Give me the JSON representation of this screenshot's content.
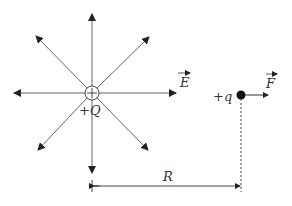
{
  "diagram": {
    "source_charge": {
      "label": "+Q",
      "x": 92,
      "y": 93,
      "radius": 7
    },
    "test_charge": {
      "label": "+q",
      "x": 241,
      "y": 95
    },
    "field_label": "E",
    "force_label": "F",
    "distance_label": "R",
    "colors": {
      "line": "#555555",
      "dot": "#111111"
    }
  }
}
